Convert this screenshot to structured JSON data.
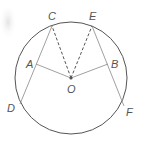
{
  "diagram": {
    "type": "circle-geometry",
    "labels": {
      "C": "C",
      "E": "E",
      "A": "A",
      "B": "B",
      "O": "O",
      "D": "D",
      "F": "F"
    },
    "segments": [
      {
        "from": "C",
        "to": "D",
        "style": "solid"
      },
      {
        "from": "E",
        "to": "F",
        "style": "solid"
      },
      {
        "from": "O",
        "to": "A",
        "style": "solid"
      },
      {
        "from": "O",
        "to": "B",
        "style": "solid"
      },
      {
        "from": "O",
        "to": "C",
        "style": "dashed"
      },
      {
        "from": "O",
        "to": "E",
        "style": "dashed"
      }
    ],
    "colors": {
      "stroke": "#555555",
      "thin": "#888888"
    }
  }
}
